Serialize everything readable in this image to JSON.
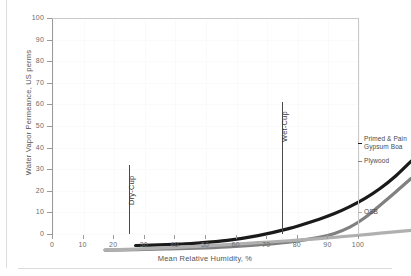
{
  "chart_data": {
    "type": "line",
    "title": "",
    "xlabel": "Mean Relative Humidity, %",
    "ylabel": "Water Vapor Permeance, US perms",
    "xlim": [
      0,
      100
    ],
    "ylim": [
      0,
      100
    ],
    "xticks": [
      0,
      10,
      20,
      30,
      40,
      50,
      60,
      70,
      80,
      90,
      100
    ],
    "yticks": [
      0,
      10,
      20,
      30,
      40,
      50,
      60,
      70,
      80,
      90,
      100
    ],
    "grid": true,
    "legend_position": "right-inline-callouts",
    "series": [
      {
        "name": "Primed & Painted Gypsum Board",
        "label_line1": "Primed & Pain",
        "label_line2": "Gypsum Boa",
        "color": "#1a1a1a",
        "width": 3.2,
        "x": [
          10,
          20,
          25,
          30,
          40,
          50,
          60,
          70,
          75,
          80,
          85,
          90,
          95,
          100
        ],
        "y": [
          3.0,
          3.4,
          3.7,
          4.1,
          5.4,
          7.6,
          10.8,
          15.2,
          17.8,
          21.0,
          24.8,
          29.5,
          35.2,
          42.0
        ]
      },
      {
        "name": "Plywood",
        "label_line1": "Plywood",
        "color": "#808080",
        "width": 3.2,
        "x": [
          0,
          10,
          20,
          30,
          40,
          50,
          60,
          70,
          75,
          80,
          85,
          90,
          95,
          100
        ],
        "y": [
          0.9,
          1.1,
          1.4,
          1.8,
          2.4,
          3.3,
          4.6,
          6.8,
          8.6,
          11.5,
          16.0,
          21.8,
          27.8,
          34.0
        ]
      },
      {
        "name": "OSB",
        "label_line1": "OSB",
        "color": "#b0b0b0",
        "width": 3.2,
        "x": [
          0,
          10,
          20,
          30,
          40,
          50,
          60,
          70,
          80,
          90,
          100
        ],
        "y": [
          1.0,
          1.3,
          1.9,
          2.6,
          3.4,
          4.3,
          5.2,
          6.2,
          7.4,
          8.7,
          10.0
        ]
      }
    ],
    "markers": [
      {
        "name": "Dry-Cup",
        "label": "Dry-Cup",
        "x": 25,
        "y_top": 32,
        "color": "#4a4a4a"
      },
      {
        "name": "Wet-Cup",
        "label": "Wet-Cup",
        "x": 75,
        "y_top": 61,
        "color": "#4a4a4a"
      }
    ]
  }
}
